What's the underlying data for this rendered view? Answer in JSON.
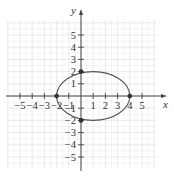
{
  "chart_data": {
    "type": "line",
    "title": "",
    "xlabel": "x",
    "ylabel": "y",
    "xlim": [
      -6,
      6
    ],
    "ylim": [
      -6,
      6
    ],
    "grid": true,
    "x_ticks": [
      -5,
      -4,
      -3,
      -2,
      -1,
      1,
      2,
      3,
      4,
      5
    ],
    "y_ticks": [
      -5,
      -4,
      -3,
      -2,
      -1,
      1,
      2,
      3,
      4,
      5
    ],
    "x_tick_labels": [
      "−5",
      "−4",
      "−3",
      "−2",
      "−1",
      "1",
      "2",
      "3",
      "4",
      "5"
    ],
    "y_tick_labels": [
      "−5",
      "−4",
      "−3",
      "−2",
      "−1",
      "1",
      "2",
      "3",
      "4",
      "5"
    ],
    "series": [
      {
        "name": "ellipse",
        "shape": "ellipse",
        "center": [
          1,
          0
        ],
        "semi_axis_x": 3,
        "semi_axis_y": 2,
        "equation": "(x-1)^2/9 + y^2/4 = 1"
      }
    ],
    "points": [
      {
        "x": -2,
        "y": 0
      },
      {
        "x": 4,
        "y": 0
      },
      {
        "x": 0,
        "y": 2
      },
      {
        "x": 0,
        "y": -2
      }
    ],
    "colors": {
      "curve": "#555555",
      "axes": "#444444",
      "grid": "#e4e4e4",
      "points": "#333333"
    }
  }
}
